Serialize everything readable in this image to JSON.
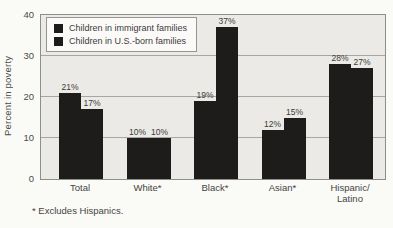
{
  "chart_data": {
    "type": "bar",
    "title": "",
    "xlabel": "",
    "ylabel": "Percent in poverty",
    "ylim": [
      0,
      40
    ],
    "yticks": [
      0,
      10,
      20,
      30,
      40
    ],
    "grid": true,
    "legend_position": "top-left",
    "value_suffix": "%",
    "categories": [
      "Total",
      "White*",
      "Black*",
      "Asian*",
      "Hispanic/ Latino"
    ],
    "series": [
      {
        "name": "Children in immigrant families",
        "values": [
          21,
          10,
          19,
          12,
          28
        ],
        "color": "#1d1c1a"
      },
      {
        "name": "Children in U.S.-born families",
        "values": [
          17,
          10,
          37,
          15,
          27
        ],
        "color": "#1d1c1a"
      }
    ]
  },
  "footnote": "* Excludes Hispanics.",
  "colors": {
    "plot_background": "#ebeae6",
    "page_background": "#fafaf7",
    "bar": "#1d1c1a",
    "gridline": "#a7a6a2",
    "border": "#8d8d89"
  }
}
